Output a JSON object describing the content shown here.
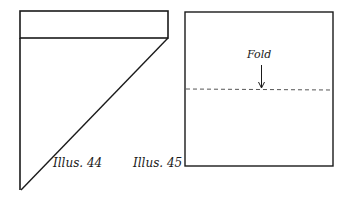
{
  "illustrations": [
    {
      "id": "illus-44",
      "caption": "Illus. 44",
      "shape": "triangle-with-top-band"
    },
    {
      "id": "illus-45",
      "caption": "Illus. 45",
      "shape": "square-with-fold-line",
      "fold_label": "Fold"
    }
  ],
  "colors": {
    "line": "#1a1a1a",
    "background": "#ffffff"
  }
}
